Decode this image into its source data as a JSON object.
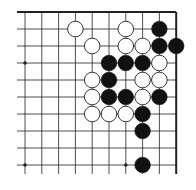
{
  "board": {
    "description": "Go board fragment (top-right corner region)",
    "columns": 10,
    "rows": 10,
    "origin_x": 25,
    "origin_y": 12,
    "spacing_x": 16.8,
    "spacing_y": 17,
    "edges": {
      "top": true,
      "right": true,
      "left": false,
      "bottom": false
    },
    "line_color": "#222222",
    "edge_line_width": 2,
    "star_points": [
      [
        0,
        3
      ],
      [
        0,
        9
      ],
      [
        6,
        9
      ]
    ],
    "stones": [
      {
        "col": 3,
        "row": 1,
        "color": "white"
      },
      {
        "col": 6,
        "row": 1,
        "color": "white"
      },
      {
        "col": 8,
        "row": 1,
        "color": "black"
      },
      {
        "col": 4,
        "row": 2,
        "color": "white"
      },
      {
        "col": 6,
        "row": 2,
        "color": "white"
      },
      {
        "col": 7,
        "row": 2,
        "color": "white"
      },
      {
        "col": 8,
        "row": 2,
        "color": "black"
      },
      {
        "col": 9,
        "row": 2,
        "color": "black"
      },
      {
        "col": 5,
        "row": 3,
        "color": "black"
      },
      {
        "col": 6,
        "row": 3,
        "color": "black"
      },
      {
        "col": 7,
        "row": 3,
        "color": "black"
      },
      {
        "col": 8,
        "row": 3,
        "color": "white"
      },
      {
        "col": 4,
        "row": 4,
        "color": "white"
      },
      {
        "col": 5,
        "row": 4,
        "color": "black"
      },
      {
        "col": 7,
        "row": 4,
        "color": "white"
      },
      {
        "col": 8,
        "row": 4,
        "color": "white"
      },
      {
        "col": 4,
        "row": 5,
        "color": "white"
      },
      {
        "col": 5,
        "row": 5,
        "color": "black"
      },
      {
        "col": 6,
        "row": 5,
        "color": "black"
      },
      {
        "col": 7,
        "row": 5,
        "color": "white"
      },
      {
        "col": 8,
        "row": 5,
        "color": "black"
      },
      {
        "col": 4,
        "row": 6,
        "color": "white"
      },
      {
        "col": 5,
        "row": 6,
        "color": "white"
      },
      {
        "col": 6,
        "row": 6,
        "color": "white"
      },
      {
        "col": 7,
        "row": 6,
        "color": "black"
      },
      {
        "col": 7,
        "row": 7,
        "color": "black"
      },
      {
        "col": 7,
        "row": 9,
        "color": "black"
      }
    ],
    "colors": {
      "black_stone": "#111111",
      "white_stone": "#ffffff",
      "white_stone_outline": "#222222"
    }
  }
}
